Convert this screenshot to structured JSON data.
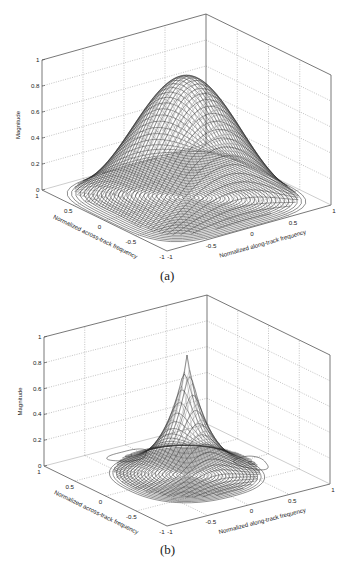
{
  "chart_data": [
    {
      "type": "surface",
      "panel_label": "(a)",
      "title": "",
      "xlabel": "Normalized along-track frequency",
      "ylabel": "Normalized across-track frequency",
      "zlabel": "Magnitude",
      "xlim": [
        -1,
        1
      ],
      "ylim": [
        -1,
        1
      ],
      "zlim": [
        0,
        1
      ],
      "x_ticks": [
        "-1",
        "-0.5",
        "0",
        "0.5",
        "1"
      ],
      "y_ticks": [
        "-1",
        "-0.5",
        "0",
        "0.5",
        "1"
      ],
      "z_ticks": [
        "0",
        "0.2",
        "0.4",
        "0.6",
        "0.8",
        "1"
      ],
      "grid": true,
      "peak": {
        "x": 0,
        "y": 0,
        "z": 0.93
      },
      "shape": "broad raised-cosine / Gaussian-like window",
      "contours_on_floor": true,
      "sidelobes": false
    },
    {
      "type": "surface",
      "panel_label": "(b)",
      "title": "",
      "xlabel": "Normalized along-track frequency",
      "ylabel": "Normalized across-track frequency",
      "zlabel": "Magnitude",
      "xlim": [
        -1,
        1
      ],
      "ylim": [
        -1,
        1
      ],
      "zlim": [
        0,
        1
      ],
      "x_ticks": [
        "-1",
        "-0.5",
        "0",
        "0.5",
        "1"
      ],
      "y_ticks": [
        "-1",
        "-0.5",
        "0",
        "0.5",
        "1"
      ],
      "z_ticks": [
        "0",
        "0.2",
        "0.4",
        "0.6",
        "0.8",
        "1"
      ],
      "grid": true,
      "peak": {
        "x": 0,
        "y": 0,
        "z": 0.93
      },
      "shape": "narrow sharply-peaked kernel",
      "contours_on_floor": true,
      "sidelobes": true
    }
  ],
  "figures": [
    {
      "caption": "(a)",
      "zlabel": "Magnitude",
      "xlabel": "Normalized along-track frequency",
      "ylabel": "Normalized across-track frequency",
      "ztick_labels": [
        "0",
        "0.2",
        "0.4",
        "0.6",
        "0.8",
        "1"
      ],
      "xtick_labels": [
        "-1",
        "-0.5",
        "0",
        "0.5",
        "1"
      ],
      "ytick_labels": [
        "1",
        "0.5",
        "0",
        "-0.5",
        "-1"
      ]
    },
    {
      "caption": "(b)",
      "zlabel": "Magnitude",
      "xlabel": "Normalized along-track frequency",
      "ylabel": "Normalized across-track frequency",
      "ztick_labels": [
        "0",
        "0.2",
        "0.4",
        "0.6",
        "0.8",
        "1"
      ],
      "xtick_labels": [
        "-1",
        "-0.5",
        "0",
        "0.5",
        "1"
      ],
      "ytick_labels": [
        "1",
        "0.5",
        "0",
        "-0.5",
        "-1"
      ]
    }
  ],
  "colors": {
    "axis": "#555555",
    "grid": "#9a9a9a",
    "mesh": "#2a2a2a",
    "contour": "#333333",
    "text": "#222222"
  }
}
